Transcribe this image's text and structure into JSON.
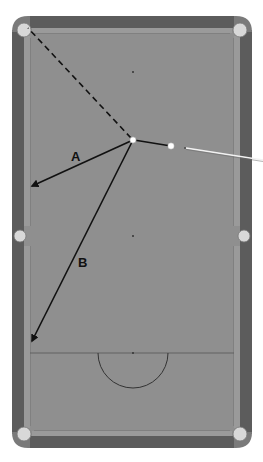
{
  "diagram": {
    "type": "pool-table-shot-diagram",
    "colors": {
      "background": "#ffffff",
      "rail": "#5c5c5c",
      "rail_edge": "#4a4a4a",
      "cushion": "#8a8a8a",
      "cloth": "#8f8f8f",
      "pocket": "#d8d8d8",
      "line": "#111111",
      "ball": "#ffffff"
    },
    "labels": {
      "path_a": "A",
      "path_b": "B"
    },
    "elements": {
      "object_ball": {
        "x": 133,
        "y": 140
      },
      "cue_ball": {
        "x": 171,
        "y": 146
      },
      "target_pocket": "top-left corner pocket",
      "dashed_line": {
        "from": [
          133,
          140
        ],
        "to": [
          28,
          27
        ]
      },
      "path_a": {
        "from": [
          133,
          140
        ],
        "to": [
          31,
          186
        ]
      },
      "path_b": {
        "from": [
          133,
          140
        ],
        "to": [
          31,
          342
        ]
      },
      "cue_to_object": {
        "from": [
          171,
          146
        ],
        "to": [
          133,
          140
        ]
      },
      "cue_stick": {
        "from": [
          186,
          148
        ],
        "to": [
          263,
          160
        ]
      },
      "head_string_y": 353,
      "d_arc": {
        "cx": 133,
        "cy": 353,
        "r": 35
      },
      "spots": [
        [
          133,
          72
        ],
        [
          133,
          236
        ],
        [
          133,
          353
        ]
      ]
    }
  }
}
